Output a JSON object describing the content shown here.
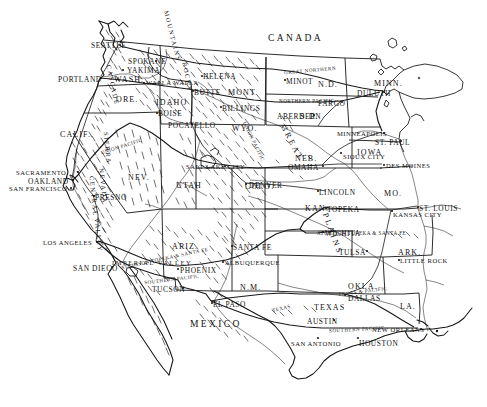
{
  "map": {
    "title": "Map of the Western United States",
    "background_color": "#ffffff",
    "ink_color": "#111111",
    "countries": [
      {
        "name": "CANADA",
        "x": 268,
        "y": 34
      },
      {
        "name": "MEXICO",
        "x": 190,
        "y": 320
      }
    ],
    "states": [
      {
        "name": "WASH.",
        "x": 114,
        "y": 76
      },
      {
        "name": "ORE.",
        "x": 116,
        "y": 96
      },
      {
        "name": "IDAHO",
        "x": 156,
        "y": 99
      },
      {
        "name": "MONT.",
        "x": 228,
        "y": 89
      },
      {
        "name": "N.D.",
        "x": 318,
        "y": 81
      },
      {
        "name": "S.D.",
        "x": 300,
        "y": 113
      },
      {
        "name": "MINN.",
        "x": 374,
        "y": 80
      },
      {
        "name": "WYO.",
        "x": 232,
        "y": 125
      },
      {
        "name": "NEB.",
        "x": 295,
        "y": 155
      },
      {
        "name": "IOWA",
        "x": 357,
        "y": 149
      },
      {
        "name": "CALIF.",
        "x": 60,
        "y": 131
      },
      {
        "name": "NEV.",
        "x": 128,
        "y": 174
      },
      {
        "name": "UTAH",
        "x": 176,
        "y": 182
      },
      {
        "name": "COLO.",
        "x": 245,
        "y": 183
      },
      {
        "name": "KAN.",
        "x": 305,
        "y": 205
      },
      {
        "name": "MO.",
        "x": 384,
        "y": 190
      },
      {
        "name": "ARIZ.",
        "x": 172,
        "y": 243
      },
      {
        "name": "N.M.",
        "x": 240,
        "y": 284
      },
      {
        "name": "OKLA.",
        "x": 348,
        "y": 283
      },
      {
        "name": "ARK.",
        "x": 398,
        "y": 249
      },
      {
        "name": "TEXAS",
        "x": 314,
        "y": 304
      },
      {
        "name": "LA.",
        "x": 400,
        "y": 303
      }
    ],
    "cities": [
      {
        "name": "SEATTLE",
        "x": 91,
        "y": 42,
        "dot_x": 119,
        "dot_y": 44
      },
      {
        "name": "SPOKANE",
        "x": 128,
        "y": 58,
        "dot_x": 155,
        "dot_y": 60
      },
      {
        "name": "YAKIMA",
        "x": 127,
        "y": 67,
        "dot_x": 122,
        "dot_y": 69
      },
      {
        "name": "PORTLAND",
        "x": 58,
        "y": 76,
        "dot_x": 100,
        "dot_y": 77
      },
      {
        "name": "WALLA WALLA",
        "x": 146,
        "y": 80,
        "dot_x": 143,
        "dot_y": 82
      },
      {
        "name": "HELENA",
        "x": 203,
        "y": 73,
        "dot_x": 201,
        "dot_y": 75
      },
      {
        "name": "BUTTE",
        "x": 194,
        "y": 89,
        "dot_x": 192,
        "dot_y": 90
      },
      {
        "name": "BILLINGS",
        "x": 222,
        "y": 105,
        "dot_x": 220,
        "dot_y": 106
      },
      {
        "name": "MINOT",
        "x": 286,
        "y": 78,
        "dot_x": 284,
        "dot_y": 79
      },
      {
        "name": "FARGO",
        "x": 318,
        "y": 100,
        "dot_x": 341,
        "dot_y": 101
      },
      {
        "name": "ABERDEEN",
        "x": 277,
        "y": 113,
        "dot_x": 313,
        "dot_y": 114
      },
      {
        "name": "DULUTH",
        "x": 357,
        "y": 90,
        "dot_x": 383,
        "dot_y": 91
      },
      {
        "name": "MINNEAPOLIS",
        "x": 337,
        "y": 131,
        "dot_x": 383,
        "dot_y": 132
      },
      {
        "name": "ST. PAUL",
        "x": 375,
        "y": 139,
        "dot_x": 400,
        "dot_y": 140
      },
      {
        "name": "BOISE",
        "x": 158,
        "y": 110,
        "dot_x": 156,
        "dot_y": 112
      },
      {
        "name": "POCATELLO",
        "x": 168,
        "y": 122,
        "dot_x": 191,
        "dot_y": 123
      },
      {
        "name": "SALT LAKE CITY",
        "x": 186,
        "y": 164,
        "dot_x": 224,
        "dot_y": 165
      },
      {
        "name": "DENVER",
        "x": 249,
        "y": 182,
        "dot_x": 245,
        "dot_y": 183
      },
      {
        "name": "SIOUX CITY",
        "x": 343,
        "y": 154,
        "dot_x": 340,
        "dot_y": 152
      },
      {
        "name": "DES MOINES",
        "x": 386,
        "y": 163,
        "dot_x": 383,
        "dot_y": 164
      },
      {
        "name": "OMAHA",
        "x": 288,
        "y": 164,
        "dot_x": 322,
        "dot_y": 165
      },
      {
        "name": "LINCOLN",
        "x": 319,
        "y": 189,
        "dot_x": 317,
        "dot_y": 190
      },
      {
        "name": "TOPEKA",
        "x": 327,
        "y": 206,
        "dot_x": 325,
        "dot_y": 207
      },
      {
        "name": "KANSAS CITY",
        "x": 393,
        "y": 212,
        "dot_x": 391,
        "dot_y": 210
      },
      {
        "name": "ST. LOUIS",
        "x": 419,
        "y": 205,
        "dot_x": 417,
        "dot_y": 206
      },
      {
        "name": "WICHITA",
        "x": 325,
        "y": 230,
        "dot_x": 322,
        "dot_y": 231
      },
      {
        "name": "TULSA",
        "x": 339,
        "y": 249,
        "dot_x": 366,
        "dot_y": 250
      },
      {
        "name": "LITTLE ROCK",
        "x": 400,
        "y": 258,
        "dot_x": 398,
        "dot_y": 259
      },
      {
        "name": "SACRAMENTO",
        "x": 16,
        "y": 170,
        "dot_x": 77,
        "dot_y": 171
      },
      {
        "name": "OAKLAND",
        "x": 28,
        "y": 178,
        "dot_x": 72,
        "dot_y": 179
      },
      {
        "name": "SAN FRANCISCO",
        "x": 9,
        "y": 186,
        "dot_x": 70,
        "dot_y": 187
      },
      {
        "name": "FRESNO",
        "x": 95,
        "y": 194,
        "dot_x": 93,
        "dot_y": 195
      },
      {
        "name": "LOS ANGELES",
        "x": 43,
        "y": 240,
        "dot_x": 96,
        "dot_y": 241
      },
      {
        "name": "SAN DIEGO",
        "x": 73,
        "y": 265,
        "dot_x": 111,
        "dot_y": 266
      },
      {
        "name": "PHOENIX",
        "x": 180,
        "y": 267,
        "dot_x": 177,
        "dot_y": 268
      },
      {
        "name": "TUCSON",
        "x": 152,
        "y": 286,
        "dot_x": 182,
        "dot_y": 287
      },
      {
        "name": "SANTA FE",
        "x": 233,
        "y": 244,
        "dot_x": 231,
        "dot_y": 245
      },
      {
        "name": "ALBUQUERQUE",
        "x": 225,
        "y": 260,
        "dot_x": 222,
        "dot_y": 261
      },
      {
        "name": "EL PASO",
        "x": 213,
        "y": 301,
        "dot_x": 211,
        "dot_y": 302
      },
      {
        "name": "DALLAS",
        "x": 348,
        "y": 295,
        "dot_x": 344,
        "dot_y": 294
      },
      {
        "name": "AUSTIN",
        "x": 307,
        "y": 318,
        "dot_x": 333,
        "dot_y": 319
      },
      {
        "name": "SAN ANTONIO",
        "x": 291,
        "y": 341,
        "dot_x": 317,
        "dot_y": 337
      },
      {
        "name": "HOUSTON",
        "x": 359,
        "y": 340,
        "dot_x": 357,
        "dot_y": 337
      },
      {
        "name": "NEW ORLEANS",
        "x": 372,
        "y": 327,
        "dot_x": 420,
        "dot_y": 328
      }
    ],
    "railroads": [
      {
        "name": "GREAT NORTHERN",
        "x": 284,
        "y": 68,
        "rotate": -5
      },
      {
        "name": "NORTHERN PACIFIC",
        "x": 279,
        "y": 99,
        "rotate": 0
      },
      {
        "name": "UNION PACIFIC",
        "x": 232,
        "y": 139,
        "rotate": 64
      },
      {
        "name": "UNION PACIFIC",
        "x": 100,
        "y": 144,
        "rotate": -18
      },
      {
        "name": "ATCHISON TOPEKA & SANTA FE",
        "x": 120,
        "y": 256,
        "rotate": -12
      },
      {
        "name": "ATCHISON TOPEKA & SANTA FE",
        "x": 317,
        "y": 231,
        "rotate": 0
      },
      {
        "name": "SOUTHERN PACIFIC",
        "x": 144,
        "y": 277,
        "rotate": -7
      },
      {
        "name": "SOUTHERN PACIFIC",
        "x": 329,
        "y": 327,
        "rotate": -3
      },
      {
        "name": "TEXAS & PACIFIC",
        "x": 338,
        "y": 289,
        "rotate": -7
      },
      {
        "name": "TEXAS",
        "x": 272,
        "y": 306,
        "rotate": -14
      }
    ],
    "physiographic": [
      {
        "name": "CASCADE",
        "x": 92,
        "y": 82,
        "rotate": 78
      },
      {
        "name": "ROCKY",
        "x": 172,
        "y": 74,
        "rotate": 78
      },
      {
        "name": "MOUNTAINS",
        "x": 146,
        "y": 33,
        "rotate": 76
      },
      {
        "name": "SIERRA",
        "x": 91,
        "y": 145,
        "rotate": 84
      },
      {
        "name": "NEVADA",
        "x": 85,
        "y": 183,
        "rotate": 84
      },
      {
        "name": "CENTRAL",
        "x": 73,
        "y": 193,
        "rotate": 84
      },
      {
        "name": "VALLEY",
        "x": 81,
        "y": 232,
        "rotate": 84
      },
      {
        "name": "IMPERIAL VALLEY",
        "x": 112,
        "y": 260,
        "rotate": 0
      }
    ],
    "regions": [
      {
        "name": "GREAT",
        "x": 272,
        "y": 139,
        "rotate": 62
      },
      {
        "name": "PLAINS",
        "x": 310,
        "y": 230,
        "rotate": 70
      }
    ]
  }
}
